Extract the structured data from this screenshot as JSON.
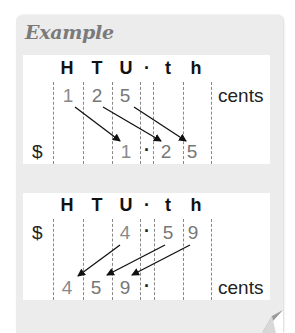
{
  "title": "Example",
  "columns": [
    "H",
    "T",
    "U",
    "·",
    "t",
    "h"
  ],
  "example1": {
    "top_row": {
      "digits": [
        "1",
        "2",
        "5"
      ],
      "unit": "cents"
    },
    "bottom_row": {
      "prefix": "$",
      "digits": [
        "1",
        "·",
        "2",
        "5"
      ]
    }
  },
  "example2": {
    "top_row": {
      "prefix": "$",
      "digits": [
        "4",
        "·",
        "5",
        "9"
      ]
    },
    "bottom_row": {
      "digits": [
        "4",
        "5",
        "9",
        "·"
      ],
      "unit": "cents"
    }
  }
}
